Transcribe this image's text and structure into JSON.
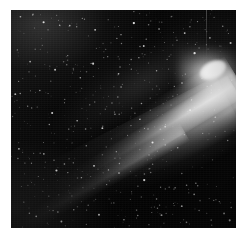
{
  "document": {
    "kind": "astronomical-photograph",
    "subject": "comet",
    "orientation": "square-crop",
    "alt_text": "Black-and-white astronomical plate photograph of a bright comet with a large white coma at the upper right and a long dust tail sweeping down toward the lower left across a dense star field."
  },
  "frame": {
    "border_color": "#ffffff",
    "border_width_px": 10,
    "canvas_width_px": 249,
    "canvas_height_px": 237,
    "plate_left_px": 11,
    "plate_top_px": 10,
    "plate_width_px": 225,
    "plate_height_px": 218
  },
  "image": {
    "background_color": "#000000",
    "sky_tone_color": "#0a0a0a",
    "highlight_color": "#ffffff",
    "midtone_color": "#b4b4b4",
    "grain_color": "#3c3c3c",
    "palette": "grayscale"
  },
  "comet": {
    "coma_label": "coma",
    "coma_center_x_pct": 89,
    "coma_center_y_pct": 28,
    "coma_brightness": "saturated-white",
    "nucleus_label": "nucleus",
    "tail_label": "dust tail",
    "tail_direction": "lower-left",
    "tail_angle_deg": -31,
    "tail_length_pct": 100,
    "tail_striations": "visible",
    "secondary_streamer_label": "secondary streamer",
    "secondary_streamer_angle_deg": -30
  },
  "starfield": {
    "label": "star field",
    "density": "dense",
    "star_color": "#ffffff",
    "stars": [
      {
        "x": 4.2,
        "y": 3.1,
        "r": 0.9,
        "b": 0.7
      },
      {
        "x": 9.8,
        "y": 1.9,
        "r": 0.7,
        "b": 0.55
      },
      {
        "x": 14.5,
        "y": 5.6,
        "r": 1.1,
        "b": 0.85
      },
      {
        "x": 20.3,
        "y": 2.4,
        "r": 0.6,
        "b": 0.45
      },
      {
        "x": 26.1,
        "y": 7.2,
        "r": 0.9,
        "b": 0.62
      },
      {
        "x": 31.7,
        "y": 3.8,
        "r": 0.7,
        "b": 0.5
      },
      {
        "x": 37.4,
        "y": 9.1,
        "r": 1.0,
        "b": 0.72
      },
      {
        "x": 43.2,
        "y": 4.5,
        "r": 0.6,
        "b": 0.48
      },
      {
        "x": 48.9,
        "y": 11.3,
        "r": 0.8,
        "b": 0.58
      },
      {
        "x": 54.6,
        "y": 6.0,
        "r": 1.2,
        "b": 0.9
      },
      {
        "x": 60.1,
        "y": 13.4,
        "r": 0.7,
        "b": 0.52
      },
      {
        "x": 65.8,
        "y": 8.7,
        "r": 0.9,
        "b": 0.66
      },
      {
        "x": 71.5,
        "y": 2.9,
        "r": 0.6,
        "b": 0.44
      },
      {
        "x": 77.2,
        "y": 10.6,
        "r": 1.0,
        "b": 0.76
      },
      {
        "x": 82.9,
        "y": 5.3,
        "r": 0.7,
        "b": 0.54
      },
      {
        "x": 88.4,
        "y": 12.8,
        "r": 0.9,
        "b": 0.68
      },
      {
        "x": 94.1,
        "y": 7.5,
        "r": 0.8,
        "b": 0.6
      },
      {
        "x": 97.6,
        "y": 15.1,
        "r": 1.1,
        "b": 0.82
      },
      {
        "x": 2.8,
        "y": 18.3,
        "r": 0.7,
        "b": 0.5
      },
      {
        "x": 8.5,
        "y": 23.7,
        "r": 0.9,
        "b": 0.64
      },
      {
        "x": 13.9,
        "y": 16.2,
        "r": 0.6,
        "b": 0.42
      },
      {
        "x": 19.6,
        "y": 27.4,
        "r": 1.0,
        "b": 0.74
      },
      {
        "x": 25.2,
        "y": 20.9,
        "r": 0.7,
        "b": 0.52
      },
      {
        "x": 30.8,
        "y": 31.1,
        "r": 0.8,
        "b": 0.58
      },
      {
        "x": 36.5,
        "y": 24.6,
        "r": 1.1,
        "b": 0.8
      },
      {
        "x": 42.1,
        "y": 18.0,
        "r": 0.6,
        "b": 0.46
      },
      {
        "x": 47.8,
        "y": 29.3,
        "r": 0.9,
        "b": 0.66
      },
      {
        "x": 53.4,
        "y": 22.7,
        "r": 0.7,
        "b": 0.5
      },
      {
        "x": 59.0,
        "y": 16.5,
        "r": 1.0,
        "b": 0.72
      },
      {
        "x": 64.7,
        "y": 27.9,
        "r": 0.8,
        "b": 0.56
      },
      {
        "x": 70.3,
        "y": 21.2,
        "r": 0.6,
        "b": 0.44
      },
      {
        "x": 76.0,
        "y": 33.5,
        "r": 0.9,
        "b": 0.62
      },
      {
        "x": 81.6,
        "y": 19.8,
        "r": 1.2,
        "b": 0.88
      },
      {
        "x": 87.2,
        "y": 35.0,
        "r": 0.7,
        "b": 0.52
      },
      {
        "x": 92.9,
        "y": 25.4,
        "r": 0.9,
        "b": 0.68
      },
      {
        "x": 98.1,
        "y": 32.2,
        "r": 0.8,
        "b": 0.58
      },
      {
        "x": 1.9,
        "y": 38.6,
        "r": 1.0,
        "b": 0.7
      },
      {
        "x": 7.4,
        "y": 44.1,
        "r": 0.7,
        "b": 0.5
      },
      {
        "x": 12.8,
        "y": 36.9,
        "r": 0.8,
        "b": 0.56
      },
      {
        "x": 18.3,
        "y": 47.3,
        "r": 1.1,
        "b": 0.78
      },
      {
        "x": 23.9,
        "y": 41.0,
        "r": 0.6,
        "b": 0.44
      },
      {
        "x": 29.4,
        "y": 50.8,
        "r": 0.9,
        "b": 0.64
      },
      {
        "x": 35.0,
        "y": 43.5,
        "r": 0.7,
        "b": 0.48
      },
      {
        "x": 40.6,
        "y": 54.2,
        "r": 1.0,
        "b": 0.74
      },
      {
        "x": 46.2,
        "y": 47.8,
        "r": 0.8,
        "b": 0.56
      },
      {
        "x": 51.8,
        "y": 57.5,
        "r": 0.6,
        "b": 0.42
      },
      {
        "x": 57.3,
        "y": 50.1,
        "r": 0.9,
        "b": 0.66
      },
      {
        "x": 62.9,
        "y": 60.8,
        "r": 1.1,
        "b": 0.82
      },
      {
        "x": 68.5,
        "y": 53.4,
        "r": 0.7,
        "b": 0.5
      },
      {
        "x": 74.1,
        "y": 63.2,
        "r": 0.8,
        "b": 0.58
      },
      {
        "x": 79.6,
        "y": 45.9,
        "r": 1.0,
        "b": 0.72
      },
      {
        "x": 85.2,
        "y": 56.6,
        "r": 0.6,
        "b": 0.46
      },
      {
        "x": 90.8,
        "y": 49.2,
        "r": 0.9,
        "b": 0.64
      },
      {
        "x": 96.3,
        "y": 59.9,
        "r": 0.8,
        "b": 0.54
      },
      {
        "x": 3.5,
        "y": 63.7,
        "r": 1.0,
        "b": 0.68
      },
      {
        "x": 9.1,
        "y": 70.3,
        "r": 0.7,
        "b": 0.48
      },
      {
        "x": 14.6,
        "y": 66.0,
        "r": 0.9,
        "b": 0.6
      },
      {
        "x": 20.2,
        "y": 73.6,
        "r": 1.1,
        "b": 0.8
      },
      {
        "x": 25.8,
        "y": 68.2,
        "r": 0.6,
        "b": 0.42
      },
      {
        "x": 31.3,
        "y": 76.9,
        "r": 0.8,
        "b": 0.56
      },
      {
        "x": 36.9,
        "y": 71.5,
        "r": 1.0,
        "b": 0.74
      },
      {
        "x": 42.5,
        "y": 80.1,
        "r": 0.7,
        "b": 0.5
      },
      {
        "x": 48.0,
        "y": 74.8,
        "r": 0.9,
        "b": 0.66
      },
      {
        "x": 53.6,
        "y": 83.4,
        "r": 0.6,
        "b": 0.44
      },
      {
        "x": 59.2,
        "y": 78.0,
        "r": 1.2,
        "b": 0.86
      },
      {
        "x": 64.7,
        "y": 86.7,
        "r": 0.8,
        "b": 0.58
      },
      {
        "x": 70.3,
        "y": 81.3,
        "r": 0.7,
        "b": 0.5
      },
      {
        "x": 75.9,
        "y": 90.0,
        "r": 1.0,
        "b": 0.7
      },
      {
        "x": 81.4,
        "y": 84.6,
        "r": 0.9,
        "b": 0.62
      },
      {
        "x": 87.0,
        "y": 93.2,
        "r": 0.6,
        "b": 0.44
      },
      {
        "x": 92.6,
        "y": 87.9,
        "r": 0.8,
        "b": 0.56
      },
      {
        "x": 97.2,
        "y": 96.5,
        "r": 1.1,
        "b": 0.78
      },
      {
        "x": 5.7,
        "y": 88.1,
        "r": 0.7,
        "b": 0.48
      },
      {
        "x": 11.2,
        "y": 94.7,
        "r": 0.9,
        "b": 0.62
      },
      {
        "x": 16.8,
        "y": 85.4,
        "r": 0.6,
        "b": 0.4
      },
      {
        "x": 22.4,
        "y": 97.0,
        "r": 1.0,
        "b": 0.72
      },
      {
        "x": 27.9,
        "y": 91.6,
        "r": 0.8,
        "b": 0.54
      },
      {
        "x": 33.5,
        "y": 98.3,
        "r": 0.7,
        "b": 0.46
      },
      {
        "x": 39.1,
        "y": 93.9,
        "r": 1.1,
        "b": 0.76
      },
      {
        "x": 44.6,
        "y": 88.5,
        "r": 0.6,
        "b": 0.42
      },
      {
        "x": 50.2,
        "y": 96.2,
        "r": 0.9,
        "b": 0.64
      },
      {
        "x": 55.8,
        "y": 91.8,
        "r": 0.8,
        "b": 0.56
      },
      {
        "x": 61.3,
        "y": 98.5,
        "r": 0.7,
        "b": 0.48
      },
      {
        "x": 66.9,
        "y": 94.1,
        "r": 1.0,
        "b": 0.7
      },
      {
        "x": 72.5,
        "y": 89.7,
        "r": 0.6,
        "b": 0.44
      },
      {
        "x": 78.0,
        "y": 97.4,
        "r": 0.9,
        "b": 0.62
      },
      {
        "x": 83.6,
        "y": 92.0,
        "r": 0.8,
        "b": 0.54
      },
      {
        "x": 89.2,
        "y": 98.7,
        "r": 0.7,
        "b": 0.46
      },
      {
        "x": 94.7,
        "y": 93.3,
        "r": 1.0,
        "b": 0.68
      }
    ]
  }
}
